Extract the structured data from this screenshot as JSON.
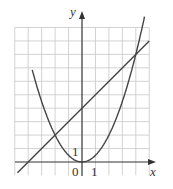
{
  "chart_data": {
    "type": "line",
    "title": "",
    "xlabel": "x",
    "ylabel": "y",
    "xlim": [
      -5,
      5
    ],
    "ylim": [
      -1,
      10.5
    ],
    "grid": true,
    "tick_labels": {
      "origin": "0",
      "x_unit": "1",
      "y_unit": "1"
    },
    "series": [
      {
        "name": "parabola",
        "equation": "y = x^2/2",
        "x": [
          -3.6,
          -3,
          -2,
          -1,
          0,
          1,
          2,
          3,
          4,
          4.6
        ],
        "values": [
          6.48,
          4.5,
          2,
          0.5,
          0,
          0.5,
          2,
          4.5,
          8,
          10.58
        ]
      },
      {
        "name": "line",
        "equation": "y = x + 4",
        "x": [
          -5,
          -4,
          -2,
          0,
          4,
          5
        ],
        "values": [
          -1,
          0,
          2,
          4,
          8,
          9
        ]
      }
    ],
    "intersections": [
      {
        "x": -2,
        "y": 2
      },
      {
        "x": 4,
        "y": 8
      }
    ]
  },
  "labels": {
    "y_axis": "y",
    "x_axis": "x",
    "origin": "0",
    "x_one": "1",
    "y_one": "1"
  }
}
